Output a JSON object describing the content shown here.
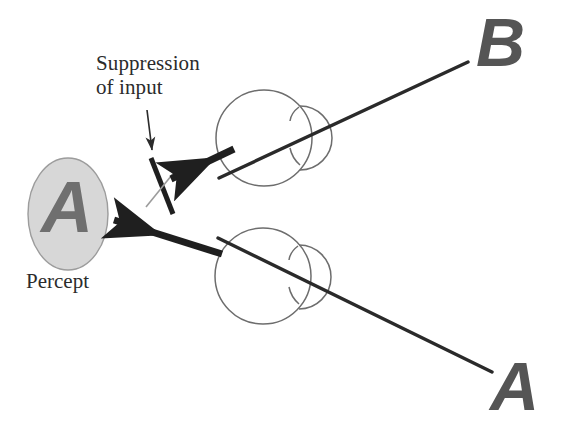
{
  "figure": {
    "background_color": "#ffffff"
  },
  "labels": {
    "suppression_line1": "Suppression",
    "suppression_line2": "of input",
    "percept": "Percept"
  },
  "stimuli": {
    "top_letter": "B",
    "bottom_letter": "A",
    "percept_letter": "A"
  },
  "colors": {
    "stimulus_letter": "#555555",
    "percept_letter": "#6f6f6f",
    "percept_ellipse_fill": "#d6d6d6",
    "percept_ellipse_stroke": "#9a9a9a",
    "eye_outline": "#6a6a6a",
    "ray_line": "#2a2a2a",
    "arrow": "#1f1f1f",
    "suppression_mark_dark": "#1f1f1f",
    "suppression_mark_light": "#9a9a9a",
    "text": "#2b2b2b"
  },
  "elements": {
    "eye_top": {
      "name": "eye-top",
      "cx": 264,
      "cy": 138,
      "r": 48
    },
    "eye_bottom": {
      "name": "eye-bottom",
      "cx": 263,
      "cy": 276,
      "r": 48
    },
    "percept_ellipse": {
      "cx": 68,
      "cy": 214,
      "rx": 40,
      "ry": 56
    },
    "ray_top": {
      "x1": 219,
      "y1": 177,
      "x2": 468,
      "y2": 62
    },
    "ray_bottom": {
      "x1": 218,
      "y1": 238,
      "x2": 492,
      "y2": 372
    },
    "arrow_suppressed": {
      "x1": 232,
      "y1": 150,
      "x2": 166,
      "y2": 180
    },
    "arrow_percept": {
      "x1": 218,
      "y1": 253,
      "x2": 112,
      "y2": 220
    },
    "arrow_annotation": {
      "x1": 148,
      "y1": 112,
      "x2": 153,
      "y2": 150
    },
    "suppression_mark": {
      "dark": {
        "x1": 152,
        "y1": 160,
        "x2": 172,
        "y2": 212
      },
      "light": {
        "x1": 148,
        "y1": 205,
        "x2": 178,
        "y2": 168
      }
    }
  }
}
